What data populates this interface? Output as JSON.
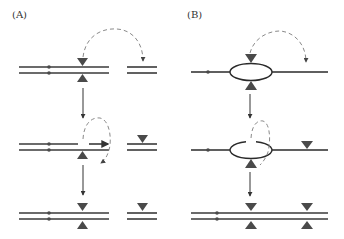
{
  "panels": {
    "A": {
      "label": "(A)"
    },
    "B": {
      "label": "(B)"
    }
  },
  "colors": {
    "strand": "#3a3a3a",
    "triangle": "#4a4a4a",
    "dashed_arrow": "#8a8a8a",
    "arrow": "#333333"
  }
}
